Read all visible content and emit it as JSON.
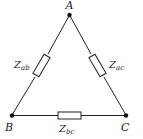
{
  "diagram": {
    "nodes": [
      {
        "id": "A",
        "label": "A"
      },
      {
        "id": "B",
        "label": "B"
      },
      {
        "id": "C",
        "label": "C"
      }
    ],
    "impedances": [
      {
        "id": "ab",
        "from": "A",
        "to": "B",
        "symbol": "Z",
        "subscript": "ab"
      },
      {
        "id": "ac",
        "from": "A",
        "to": "C",
        "symbol": "Z",
        "subscript": "ac"
      },
      {
        "id": "bc",
        "from": "B",
        "to": "C",
        "symbol": "Z",
        "subscript": "bc"
      }
    ],
    "colors": {
      "line": "#222222",
      "background": "#ffffff"
    }
  }
}
